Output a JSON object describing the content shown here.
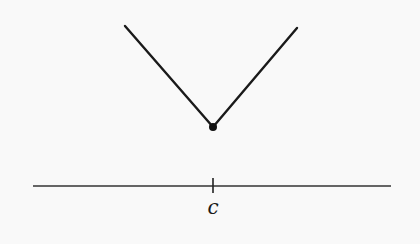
{
  "diagram": {
    "title": "",
    "colors": {
      "background": "#f9f9f9",
      "stroke": "#1a1a1a"
    },
    "curve": {
      "left_branch": {
        "x1": 125,
        "y1": 26,
        "x2": 213,
        "y2": 127
      },
      "right_branch": {
        "x1": 213,
        "y1": 127,
        "x2": 297,
        "y2": 28
      },
      "vertex_point": {
        "cx": 213,
        "cy": 127,
        "r": 4
      }
    },
    "axis": {
      "x1": 33,
      "y1": 186,
      "x2": 391,
      "y2": 186,
      "tick": {
        "x": 213,
        "y1": 178,
        "y2": 193
      },
      "tick_label": "c",
      "tick_label_pos": {
        "x": 213,
        "y": 214
      }
    }
  }
}
